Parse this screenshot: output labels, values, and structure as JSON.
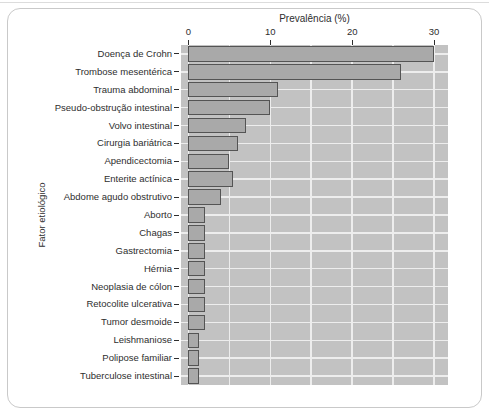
{
  "figure": {
    "title": "Prevalência (%)",
    "y_axis_title": "Fator etiológico"
  },
  "chart_data": {
    "type": "bar",
    "orientation": "horizontal",
    "title": "Prevalência (%)",
    "xlabel": "Prevalência (%)",
    "ylabel": "Fator etiológico",
    "categories": [
      "Doença de Crohn",
      "Trombose mesentérica",
      "Trauma abdominal",
      "Pseudo-obstrução intestinal",
      "Volvo intestinal",
      "Cirurgia bariátrica",
      "Apendicectomia",
      "Enterite actínica",
      "Abdome agudo obstrutivo",
      "Aborto",
      "Chagas",
      "Gastrectomia",
      "Hérnia",
      "Neoplasia de cólon",
      "Retocolite ulcerativa",
      "Tumor desmoide",
      "Leishmaniose",
      "Polipose familiar",
      "Tuberculose intestinal"
    ],
    "values": [
      30,
      26,
      11,
      10,
      7,
      6,
      5,
      5.5,
      4,
      2,
      2,
      2,
      2,
      2,
      2,
      2,
      1.3,
      1.3,
      1.3
    ],
    "x_ticks": [
      0,
      10,
      20,
      30
    ],
    "xlim": [
      -0.9,
      31.7
    ],
    "grid": true,
    "grid_step": 5,
    "legend": false
  },
  "colors": {
    "plot_background": "#c2c2c2",
    "bar_fill": "#a9a9a9",
    "bar_border": "#545454",
    "gridline": "#ededed",
    "text": "#2e2e2e",
    "frame_border": "#c9c9c9",
    "top_rule": "#dcdcdc",
    "page_background": "#ffffff"
  }
}
